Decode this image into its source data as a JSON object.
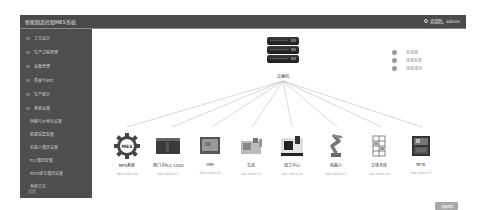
{
  "header": {
    "title": "智能制造控制MES系统",
    "user_label": "欢迎您，admin"
  },
  "sidebar": {
    "items": [
      {
        "label": "工艺设计"
      },
      {
        "label": "生产过程管理"
      },
      {
        "label": "设备管理"
      },
      {
        "label": "质量与SPC"
      },
      {
        "label": "生产统计"
      },
      {
        "label": "系统设置"
      }
    ],
    "sub_items": [
      {
        "label": "网络与IP地址设置"
      },
      {
        "label": "数据采集配置"
      },
      {
        "label": "机器人通讯设置"
      },
      {
        "label": "PLC通讯配置"
      },
      {
        "label": "RFID读写通讯设置"
      },
      {
        "label": "系统日志"
      }
    ],
    "collapse_button": ""
  },
  "topology": {
    "switch_label": "交换机",
    "legend": [
      {
        "label": "未连接",
        "color": "#9a9a9a"
      },
      {
        "label": "连接失败",
        "color": "#9a9a9a"
      },
      {
        "label": "连接成功",
        "color": "#9a9a9a"
      }
    ],
    "devices": [
      {
        "name": "MES系统",
        "ip": "192.168.0.10",
        "icon": "mes-gear-icon"
      },
      {
        "name": "西门子PLC 1200",
        "ip": "192.168.0.11",
        "icon": "plc-icon"
      },
      {
        "name": "HMI",
        "ip": "192.168.0.12",
        "icon": "hmi-icon"
      },
      {
        "name": "车床",
        "ip": "192.168.0.13",
        "icon": "lathe-icon"
      },
      {
        "name": "加工中心",
        "ip": "192.168.0.14",
        "icon": "machining-center-icon"
      },
      {
        "name": "机器人",
        "ip": "192.168.0.15",
        "icon": "robot-arm-icon"
      },
      {
        "name": "立体仓库",
        "ip": "192.168.0.16",
        "icon": "warehouse-icon"
      },
      {
        "name": "RFID",
        "ip": "192.168.0.17",
        "icon": "rfid-icon"
      }
    ],
    "confirm_button": "连接测试"
  }
}
